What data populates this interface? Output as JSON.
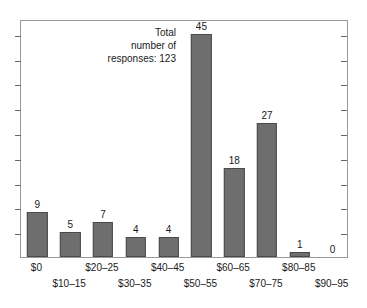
{
  "chart_data": {
    "type": "bar",
    "title": "",
    "subtitle": "",
    "xlabel": "",
    "ylabel": "",
    "categories": [
      "$0",
      "$10–15",
      "$20–25",
      "$30–35",
      "$40–45",
      "$50–55",
      "$60–65",
      "$70–75",
      "$80–85",
      "$90–95"
    ],
    "values": [
      9,
      5,
      7,
      4,
      4,
      45,
      18,
      27,
      1,
      0
    ],
    "value_labels": [
      "9",
      "5",
      "7",
      "4",
      "4",
      "45",
      "18",
      "27",
      "1",
      "0"
    ],
    "ylim": [
      0,
      48
    ],
    "y_tick_values": [
      5,
      10,
      15,
      20,
      25,
      30,
      35,
      40,
      45
    ],
    "y_tick_labels": [],
    "grid": false,
    "legend": null,
    "legend_position": "none",
    "annotations": [
      {
        "text": "Total\nnumber of\nresponses: 123",
        "align": "right"
      }
    ],
    "colors": {
      "bar_fill": "#6e6e6e",
      "bar_edge": "#4a4a4a",
      "frame": "#9a9a9a",
      "tick": "#6a6a6a",
      "text": "#1a1a1a",
      "background": "#ffffff"
    },
    "x_label_rows": [
      0,
      1,
      0,
      1,
      0,
      1,
      0,
      1,
      0,
      1
    ]
  }
}
